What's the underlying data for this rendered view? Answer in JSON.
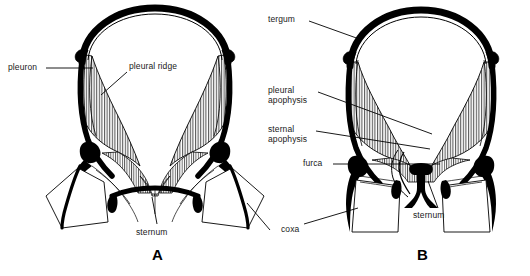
{
  "figure": {
    "type": "anatomical-line-diagram",
    "background_color": "#ffffff",
    "ink_color": "#000000",
    "panels": [
      {
        "id": "A",
        "letter": "A",
        "letter_x": 152,
        "letter_y": 248,
        "labels": [
          {
            "name": "pleuron",
            "text": "pleuron",
            "x": 8,
            "y": 63,
            "leader": [
              [
                46,
                68
              ],
              [
                93,
                68
              ]
            ]
          },
          {
            "name": "pleural-ridge",
            "text": "pleural ridge",
            "x": 129,
            "y": 62,
            "leader": [
              [
                127,
                72
              ],
              [
                101,
                94
              ]
            ]
          },
          {
            "name": "sternum",
            "text": "sternum",
            "x": 136,
            "y": 228,
            "leader": [
              [
                156,
                226
              ],
              [
                152,
                196
              ]
            ]
          }
        ]
      },
      {
        "id": "B",
        "letter": "B",
        "letter_x": 417,
        "letter_y": 248,
        "labels": [
          {
            "name": "tergum",
            "text": "tergum",
            "x": 268,
            "y": 15,
            "leader": [
              [
                308,
                21
              ],
              [
                360,
                39
              ]
            ]
          },
          {
            "name": "pleural-apophysis",
            "text": "pleural apophysis",
            "line1": "pleural",
            "line2": "apophysis",
            "x": 268,
            "y": 86,
            "leader": [
              [
                318,
                91
              ],
              [
                430,
                133
              ]
            ]
          },
          {
            "name": "sternal-apophysis",
            "text": "sternal apophysis",
            "line1": "sternal",
            "line2": "apophysis",
            "x": 268,
            "y": 125,
            "leader": [
              [
                316,
                130
              ],
              [
                432,
                148
              ]
            ]
          },
          {
            "name": "furca",
            "text": "furca",
            "x": 303,
            "y": 159,
            "leader": [
              [
                332,
                164
              ],
              [
                440,
                164
              ]
            ]
          },
          {
            "name": "coxa",
            "text": "coxa",
            "x": 281,
            "y": 225,
            "leader": [
              [
                304,
                224
              ],
              [
                355,
                209
              ]
            ]
          },
          {
            "name": "sternum",
            "text": "sternum",
            "x": 413,
            "y": 211,
            "leader": [
              [
                437,
                209
              ],
              [
                427,
                180
              ]
            ]
          }
        ]
      }
    ],
    "coxa_extra_leader_panelA": [
      [
        247,
        203
      ],
      [
        268,
        229
      ]
    ],
    "caption_fragment": ""
  }
}
